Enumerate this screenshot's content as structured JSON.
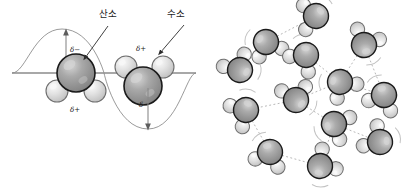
{
  "figure": {
    "panels": [
      {
        "id": "polarity",
        "name": "polarity-wave-panel",
        "labels": {
          "oxygen": "산소",
          "hydrogen": "수소"
        },
        "charge_labels": {
          "negative": "δ−",
          "positive": "δ+"
        },
        "molecules": [
          {
            "name": "water-molecule-left",
            "orientation": "oxygen-up",
            "oxygen": {
              "cx": 76,
              "cy": 73,
              "r": 19
            },
            "hydrogens": [
              {
                "cx": 57,
                "cy": 91,
                "r": 11
              },
              {
                "cx": 95,
                "cy": 91,
                "r": 11
              }
            ],
            "negative_pole": {
              "x": 72,
              "y": 50,
              "text": "δ−"
            },
            "positive_pole": {
              "x": 73,
              "y": 109,
              "text": "δ+"
            }
          },
          {
            "name": "water-molecule-right",
            "orientation": "oxygen-down",
            "oxygen": {
              "cx": 143,
              "cy": 86,
              "r": 19
            },
            "hydrogens": [
              {
                "cx": 126,
                "cy": 67,
                "r": 11
              },
              {
                "cx": 163,
                "cy": 67,
                "r": 11
              }
            ],
            "negative_pole": {
              "x": 144,
              "y": 104,
              "text": "δ−"
            },
            "positive_pole": {
              "x": 140,
              "y": 50,
              "text": "δ+"
            }
          }
        ],
        "axis": {
          "y": 73,
          "x1": 12,
          "x2": 196
        },
        "wave": {
          "amplitude": 44,
          "crest_x": 62,
          "trough_x": 148
        },
        "arrows": [
          {
            "name": "dipole-arrow-up",
            "x": 66,
            "from_y": 73,
            "to_y": 30,
            "direction": "up"
          },
          {
            "name": "dipole-arrow-down",
            "x": 148,
            "from_y": 86,
            "to_y": 129,
            "direction": "down"
          }
        ]
      },
      {
        "id": "hydrogen-bond-network",
        "name": "hydrogen-bond-network-panel",
        "molecule_count": 13,
        "molecules": [
          {
            "cx": 58,
            "cy": 42,
            "rot": -25
          },
          {
            "cx": 32,
            "cy": 70,
            "rot": 145
          },
          {
            "cx": 98,
            "cy": 55,
            "rot": 35
          },
          {
            "cx": 156,
            "cy": 45,
            "rot": 200
          },
          {
            "cx": 132,
            "cy": 82,
            "rot": -40
          },
          {
            "cx": 176,
            "cy": 95,
            "rot": 20
          },
          {
            "cx": 88,
            "cy": 100,
            "rot": 165
          },
          {
            "cx": 38,
            "cy": 110,
            "rot": 55
          },
          {
            "cx": 126,
            "cy": 124,
            "rot": -70
          },
          {
            "cx": 172,
            "cy": 142,
            "rot": 120
          },
          {
            "cx": 62,
            "cy": 152,
            "rot": 15
          },
          {
            "cx": 112,
            "cy": 166,
            "rot": 230
          },
          {
            "cx": 108,
            "cy": 16,
            "rot": 80
          }
        ],
        "bonds": [
          {
            "x1": 58,
            "y1": 42,
            "x2": 32,
            "y2": 70
          },
          {
            "x1": 58,
            "y1": 42,
            "x2": 98,
            "y2": 55
          },
          {
            "x1": 98,
            "y1": 55,
            "x2": 132,
            "y2": 82
          },
          {
            "x1": 132,
            "y1": 82,
            "x2": 156,
            "y2": 45
          },
          {
            "x1": 132,
            "y1": 82,
            "x2": 176,
            "y2": 95
          },
          {
            "x1": 88,
            "y1": 100,
            "x2": 132,
            "y2": 82
          },
          {
            "x1": 88,
            "y1": 100,
            "x2": 38,
            "y2": 110
          },
          {
            "x1": 88,
            "y1": 100,
            "x2": 126,
            "y2": 124
          },
          {
            "x1": 126,
            "y1": 124,
            "x2": 172,
            "y2": 142
          },
          {
            "x1": 126,
            "y1": 124,
            "x2": 112,
            "y2": 166
          },
          {
            "x1": 62,
            "y1": 152,
            "x2": 112,
            "y2": 166
          },
          {
            "x1": 38,
            "y1": 110,
            "x2": 62,
            "y2": 152
          },
          {
            "x1": 58,
            "y1": 42,
            "x2": 108,
            "y2": 16
          },
          {
            "x1": 156,
            "y1": 45,
            "x2": 176,
            "y2": 95
          }
        ]
      }
    ]
  },
  "colors": {
    "oxygen_fill": "#9b9b9b",
    "oxygen_stroke": "#1a1a1a",
    "oxygen_highlight": "#cfcfcf",
    "hydrogen_fill": "#dcdcdc",
    "hydrogen_stroke": "#6e6e6e",
    "hydrogen_highlight": "#f4f4f4",
    "axis_line": "#8b8b8b",
    "wave_line": "#7a7a7a",
    "bond_line": "#b8b8b8",
    "leader_line": "#3a3a3a",
    "background": "#ffffff"
  }
}
